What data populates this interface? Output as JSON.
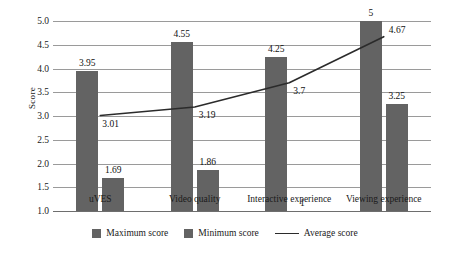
{
  "chart_data": {
    "type": "bar",
    "title": "",
    "subtitle": "",
    "xlabel": "",
    "ylabel": "Score",
    "ylim": [
      1.0,
      5.0
    ],
    "ytick_labels": [
      "5.0",
      "4.5",
      "4.0",
      "3.5",
      "3.0",
      "2.5",
      "2.0",
      "1.5",
      "1.0"
    ],
    "ytick_values": [
      5.0,
      4.5,
      4.0,
      3.5,
      3.0,
      2.5,
      2.0,
      1.5,
      1.0
    ],
    "grid": true,
    "legend_position": "bottom",
    "categories": [
      "uVES",
      "Video quality",
      "Interactive experience",
      "Viewing experience"
    ],
    "series": [
      {
        "name": "Maximum score",
        "type": "bar",
        "color": "#636363",
        "values": [
          3.95,
          4.55,
          4.25,
          5
        ],
        "labels": [
          "3.95",
          "4.55",
          "4.25",
          "5"
        ]
      },
      {
        "name": "Minimum score",
        "type": "bar",
        "color": "#636363",
        "values": [
          1.69,
          1.86,
          1,
          3.25
        ],
        "labels": [
          "1.69",
          "1.86",
          "1",
          "3.25"
        ]
      },
      {
        "name": "Average score",
        "type": "line",
        "color": "#2b2b2b",
        "values": [
          3.01,
          3.19,
          3.7,
          4.67
        ],
        "labels": [
          "3.01",
          "3.19",
          "3.7",
          "4.67"
        ]
      }
    ]
  },
  "legend": {
    "items": [
      {
        "label": "Maximum score",
        "marker": "square-swatch-icon"
      },
      {
        "label": "Minimum score",
        "marker": "square-swatch-icon"
      },
      {
        "label": "Average score",
        "marker": "line-swatch-icon"
      }
    ]
  }
}
